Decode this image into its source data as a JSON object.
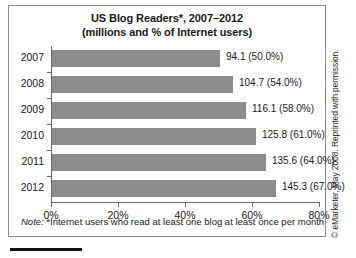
{
  "chart_data": {
    "type": "bar",
    "orientation": "horizontal",
    "title": "US Blog Readers*, 2007–2012",
    "subtitle": "(millions and % of Internet users)",
    "xlabel": "",
    "ylabel": "",
    "categories": [
      "2007",
      "2008",
      "2009",
      "2010",
      "2011",
      "2012"
    ],
    "values": [
      50.0,
      54.0,
      58.0,
      61.0,
      64.0,
      67.0
    ],
    "millions": [
      94.1,
      104.7,
      116.1,
      125.8,
      135.6,
      145.3
    ],
    "data_labels": [
      "94.1 (50.0%)",
      "104.7 (54.0%)",
      "116.1 (58.0%)",
      "125.8 (61.0%)",
      "135.6 (64.0%)",
      "145.3 (67.0%)"
    ],
    "xlim": [
      0,
      80
    ],
    "xticks": [
      0,
      20,
      40,
      60,
      80
    ],
    "xtick_labels": [
      "0%",
      "20%",
      "40%",
      "60%",
      "80%"
    ],
    "grid": false,
    "legend": false,
    "bar_color": "#8c8c8c",
    "axis_color": "#6a6a6a",
    "note_lead": "Note:",
    "note_text": "*Internet users who read at least one blog at least once per month",
    "credit": "© eMarketer, May 2008. Reprinted with permission."
  }
}
